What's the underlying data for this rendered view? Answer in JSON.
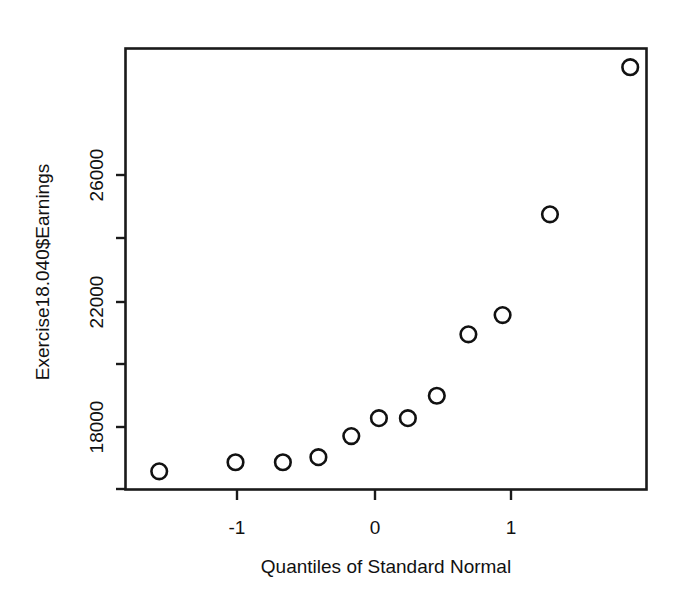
{
  "chart_data": {
    "type": "scatter",
    "title": "",
    "subtitle": "",
    "xlabel": "Quantiles of Standard Normal",
    "ylabel": "Exercise18.040$Earnings",
    "xlim": [
      -1.98,
      1.98
    ],
    "ylim": [
      16000,
      30000
    ],
    "grid": false,
    "legend": null,
    "legend_position": "none",
    "xticks": [
      -1,
      0,
      1
    ],
    "xticklabels": [
      "-1",
      "0",
      "1"
    ],
    "yticks": [
      18000,
      20000,
      22000,
      24000,
      26000,
      28000
    ],
    "yticklabels": [
      "18000",
      "",
      "22000",
      "",
      "26000",
      ""
    ],
    "marker": "open-circle",
    "marker_color": "#111111",
    "x": [
      -1.72,
      -1.14,
      -0.78,
      -0.51,
      -0.26,
      -0.05,
      0.17,
      0.39,
      0.63,
      0.89,
      1.25,
      1.86
    ],
    "y": [
      16560,
      16850,
      16850,
      17010,
      17680,
      18250,
      18250,
      18960,
      20910,
      21520,
      24720,
      29390
    ],
    "points": [
      {
        "x": -1.72,
        "y": 16560
      },
      {
        "x": -1.14,
        "y": 16850
      },
      {
        "x": -0.78,
        "y": 16850
      },
      {
        "x": -0.51,
        "y": 17010
      },
      {
        "x": -0.26,
        "y": 17680
      },
      {
        "x": -0.05,
        "y": 18250
      },
      {
        "x": 0.17,
        "y": 18250
      },
      {
        "x": 0.39,
        "y": 18960
      },
      {
        "x": 0.63,
        "y": 20910
      },
      {
        "x": 0.89,
        "y": 21520
      },
      {
        "x": 1.25,
        "y": 24720
      },
      {
        "x": 1.86,
        "y": 29390
      }
    ]
  },
  "figure": {
    "background_color": "#ffffff",
    "axis_color": "#111111",
    "x_axis_label": "Quantiles of Standard Normal",
    "y_axis_label": "Exercise18.040$Earnings",
    "x_tick_labels": [
      "-1",
      "0",
      "1"
    ],
    "y_tick_labels": [
      "18000",
      "22000",
      "26000"
    ]
  }
}
